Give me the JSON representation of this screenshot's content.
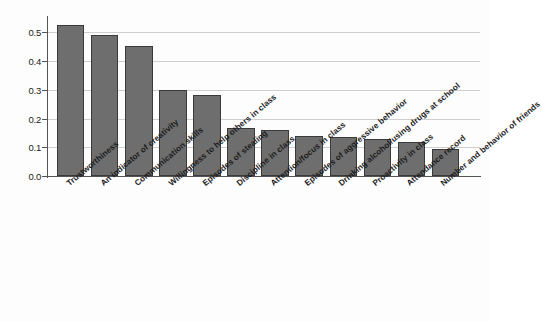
{
  "chart_data": {
    "type": "bar",
    "title": "",
    "subtitle": "",
    "xlabel": "",
    "ylabel": "",
    "ylim": [
      0.0,
      0.55
    ],
    "ytick_labels": [
      "0.0",
      "0.1",
      "0.2",
      "0.3",
      "0.4",
      "0.5"
    ],
    "ytick_values": [
      0.0,
      0.1,
      0.2,
      0.3,
      0.4,
      0.5
    ],
    "grid": true,
    "grid_axis": "y",
    "legend": null,
    "legend_position": "none",
    "bar_color": "#6e6e6e",
    "bar_edge_color": "#3a3a3a",
    "grid_color": "#cfcfcf",
    "axis_color": "#555555",
    "background_color": "#fdfdfd",
    "xtick_label_rotation": -40,
    "categories": [
      "Trustworthiness",
      "An indicator of creativity",
      "Communication skills",
      "Willingness to help others in class",
      "Episodes of stealing",
      "Discipline in class",
      "Attention/focus in class",
      "Episodes of aggressive behavior",
      "Drinking alcohol/using drugs at school",
      "Proactivity in class",
      "Attendance record",
      "Number and behavior of friends"
    ],
    "values": [
      0.525,
      0.49,
      0.452,
      0.298,
      0.281,
      0.167,
      0.161,
      0.141,
      0.137,
      0.129,
      0.117,
      0.094
    ]
  }
}
